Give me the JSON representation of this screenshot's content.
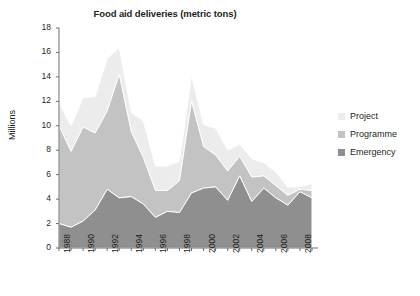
{
  "chart_data": {
    "type": "area",
    "stacked": true,
    "title": "Food aid deliveries (metric tons)",
    "xlabel": "",
    "ylabel": "Millions",
    "ylim": [
      0,
      18
    ],
    "ytick_step": 2,
    "yticks": [
      0,
      2,
      4,
      6,
      8,
      10,
      12,
      14,
      16,
      18
    ],
    "xlim": [
      1988,
      2009
    ],
    "xticks": [
      1988,
      1990,
      1992,
      1994,
      1996,
      1998,
      2000,
      2002,
      2004,
      2006,
      2008
    ],
    "xtick_labels": [
      "1988",
      "1990",
      "1992",
      "1994",
      "1996",
      "1998",
      "2000",
      "2002",
      "2004",
      "2006",
      "2008"
    ],
    "x": [
      1988,
      1989,
      1990,
      1991,
      1992,
      1993,
      1994,
      1995,
      1996,
      1997,
      1998,
      1999,
      2000,
      2001,
      2002,
      2003,
      2004,
      2005,
      2006,
      2007,
      2008,
      2009
    ],
    "grid": false,
    "legend_position": "right",
    "series": [
      {
        "name": "Emergency",
        "color": "#8f8f8f",
        "values": [
          2.0,
          1.7,
          2.2,
          3.1,
          4.8,
          4.1,
          4.2,
          3.6,
          2.5,
          3.0,
          2.9,
          4.5,
          4.9,
          5.0,
          3.9,
          5.9,
          3.8,
          4.9,
          4.1,
          3.5,
          4.6,
          4.1
        ]
      },
      {
        "name": "Programme",
        "color": "#c3c3c3",
        "values": [
          8.0,
          6.2,
          7.7,
          6.3,
          6.4,
          10.1,
          5.3,
          3.8,
          2.2,
          1.7,
          2.6,
          7.5,
          3.4,
          2.6,
          2.4,
          1.6,
          2.0,
          1.0,
          1.0,
          0.8,
          0.2,
          0.6
        ]
      },
      {
        "name": "Project",
        "color": "#ececec",
        "values": [
          1.9,
          2.1,
          2.4,
          3.0,
          4.3,
          2.2,
          1.6,
          3.0,
          2.0,
          2.0,
          1.6,
          2.1,
          1.8,
          2.2,
          1.7,
          1.0,
          1.5,
          1.1,
          1.1,
          0.7,
          0.2,
          0.6
        ]
      }
    ],
    "totals": [
      11.9,
      10.0,
      12.3,
      12.4,
      15.5,
      16.4,
      11.1,
      10.4,
      6.7,
      6.7,
      7.1,
      14.1,
      10.1,
      9.8,
      8.0,
      8.5,
      7.3,
      7.0,
      6.2,
      5.0,
      5.0,
      5.3
    ]
  },
  "legend": {
    "items": [
      {
        "label": "Project",
        "color": "#ececec"
      },
      {
        "label": "Programme",
        "color": "#c3c3c3"
      },
      {
        "label": "Emergency",
        "color": "#8f8f8f"
      }
    ]
  },
  "axis": {
    "color": "#6d6e71"
  }
}
